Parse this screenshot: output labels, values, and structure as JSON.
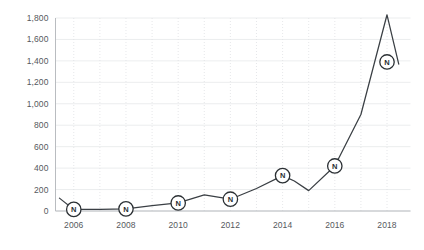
{
  "chart_data": {
    "type": "line",
    "title": "",
    "subtitle": "",
    "xlabel": "",
    "ylabel": "",
    "xlim": [
      2005.3,
      2018.9
    ],
    "ylim": [
      0,
      1800
    ],
    "grid": "both-light-horizontal-solid-vertical-dotted",
    "legend": "none",
    "y_ticks": [
      0,
      200,
      400,
      600,
      800,
      1000,
      1200,
      1400,
      1600,
      1800
    ],
    "y_tick_labels": [
      "0",
      "200",
      "400",
      "600",
      "800",
      "1,000",
      "1,200",
      "1,400",
      "1,600",
      "1,800"
    ],
    "x_ticks": [
      2006,
      2008,
      2010,
      2012,
      2014,
      2016,
      2018
    ],
    "x_tick_labels": [
      "2006",
      "2008",
      "2010",
      "2012",
      "2014",
      "2016",
      "2018"
    ],
    "x_minor_ticks": [
      2007,
      2009,
      2011,
      2013,
      2015,
      2017
    ],
    "marker_symbol": "N",
    "marker_style": "circled-letter",
    "line_color": "#3a3f44",
    "marker_fill": "#ffffff",
    "marker_stroke": "#2b3034",
    "grid_color_horizontal": "#e6e8ea",
    "grid_color_vertical": "#dfe1e4",
    "axis_color": "#b9bcc0",
    "tick_label_color": "#55595d",
    "background_color": "#ffffff",
    "series": [
      {
        "name": "N",
        "x": [
          2005.45,
          2006,
          2007,
          2008,
          2009,
          2010,
          2011,
          2012,
          2013,
          2014,
          2014.45,
          2015,
          2016,
          2017,
          2018,
          2018.45
        ],
        "values": [
          120,
          15,
          15,
          20,
          50,
          75,
          150,
          110,
          210,
          330,
          280,
          190,
          420,
          900,
          1830,
          1370
        ],
        "marker_x": [
          2006,
          2008,
          2010,
          2012,
          2014,
          2016,
          2018
        ],
        "marker_values": [
          15,
          20,
          75,
          110,
          330,
          420,
          1390
        ]
      }
    ]
  }
}
